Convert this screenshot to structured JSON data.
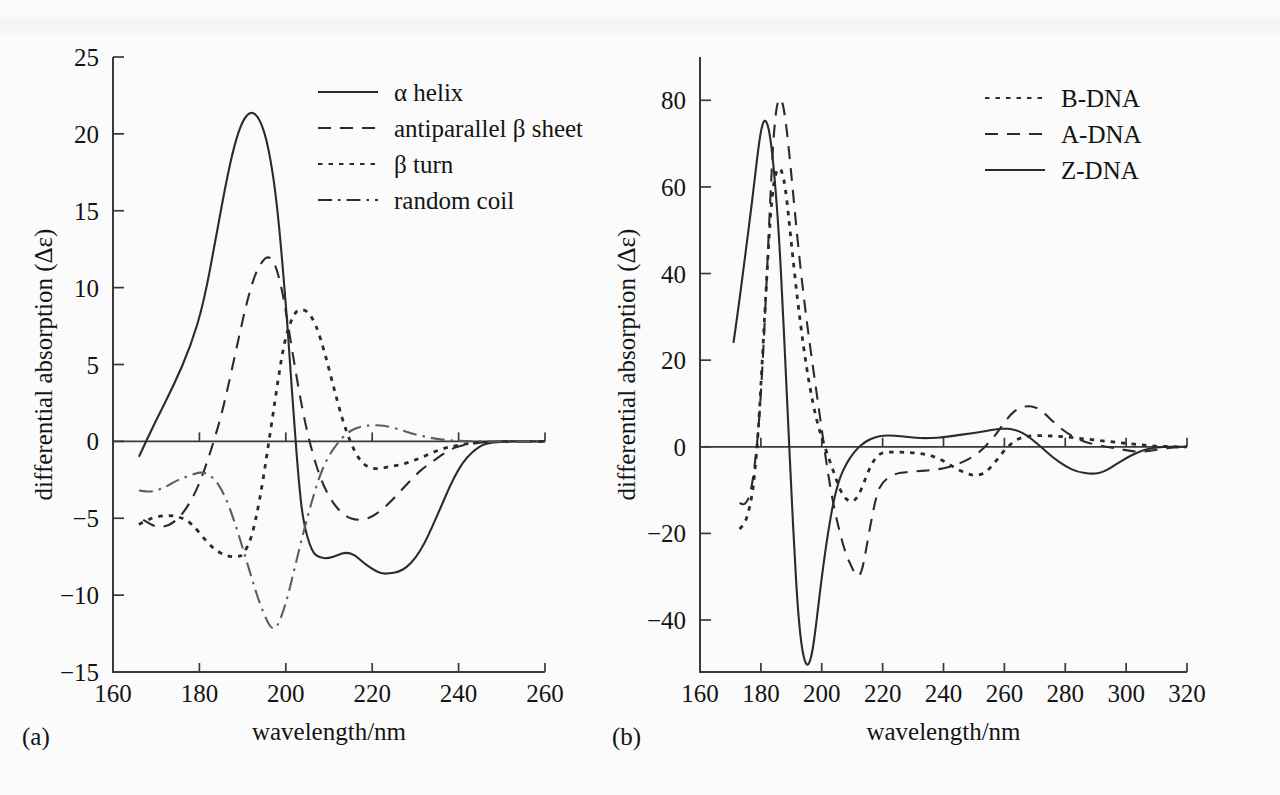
{
  "figure": {
    "background_color": "#fbfbfb",
    "ink_color": "#2b2b2b",
    "grey_color": "#5d5d5d"
  },
  "panels": [
    {
      "tag": "(a)",
      "xlabel": "wavelength/nm",
      "ylabel": "differential absorption (Δε)",
      "xticks": [
        160,
        180,
        200,
        220,
        240,
        260
      ],
      "yticks": [
        25,
        20,
        15,
        10,
        5,
        0,
        -5,
        -10,
        -15
      ],
      "xtick_labels": [
        "160",
        "180",
        "200",
        "220",
        "240",
        "260"
      ],
      "ytick_labels": [
        "25",
        "20",
        "15",
        "10",
        "5",
        "0",
        "−5",
        "−10",
        "−15"
      ],
      "legend": [
        {
          "label": "α helix",
          "style": "solid"
        },
        {
          "label": "antiparallel β sheet",
          "style": "dashed"
        },
        {
          "label": "β turn",
          "style": "dotted"
        },
        {
          "label": "random coil",
          "style": "dashdot"
        }
      ]
    },
    {
      "tag": "(b)",
      "xlabel": "wavelength/nm",
      "ylabel": "differential absorption (Δε)",
      "xticks": [
        160,
        180,
        200,
        220,
        240,
        260,
        280,
        300,
        320
      ],
      "yticks": [
        80,
        60,
        40,
        20,
        0,
        -20,
        -40
      ],
      "xtick_labels": [
        "160",
        "180",
        "200",
        "220",
        "240",
        "260",
        "280",
        "300",
        "320"
      ],
      "ytick_labels": [
        "80",
        "60",
        "40",
        "20",
        "0",
        "−20",
        "−40"
      ],
      "legend": [
        {
          "label": "B-DNA",
          "style": "dotted"
        },
        {
          "label": "A-DNA",
          "style": "dashed"
        },
        {
          "label": "Z-DNA",
          "style": "solid"
        }
      ]
    }
  ],
  "chart_data": [
    {
      "type": "line",
      "title": "",
      "panel": "(a)",
      "xlabel": "wavelength/nm",
      "ylabel": "differential absorption (Δε)",
      "xlim": [
        160,
        260
      ],
      "ylim": [
        -15,
        25
      ],
      "grid": false,
      "legend_position": "top-right",
      "series": [
        {
          "name": "α helix",
          "style": "solid",
          "x": [
            166,
            170,
            174,
            178,
            181,
            184,
            186,
            188,
            190,
            192,
            194,
            196,
            198,
            200,
            201,
            202,
            203,
            204,
            206,
            208,
            210,
            212,
            214,
            216,
            218,
            220,
            222,
            224,
            226,
            228,
            230,
            232,
            234,
            236,
            238,
            240,
            242,
            244,
            246,
            250,
            256,
            260
          ],
          "y": [
            -1.0,
            1.4,
            3.6,
            6.2,
            9.0,
            13.5,
            16.6,
            19.2,
            20.9,
            21.5,
            21.0,
            19.2,
            15.5,
            9.0,
            5.0,
            1.0,
            -2.6,
            -5.2,
            -7.2,
            -7.6,
            -7.6,
            -7.4,
            -7.2,
            -7.4,
            -7.9,
            -8.3,
            -8.6,
            -8.6,
            -8.5,
            -8.2,
            -7.6,
            -6.7,
            -5.5,
            -4.2,
            -2.9,
            -1.8,
            -1.0,
            -0.5,
            -0.15,
            0.0,
            0.0,
            0.0
          ]
        },
        {
          "name": "antiparallel β sheet",
          "style": "dashed",
          "x": [
            167,
            170,
            173,
            176,
            179,
            181,
            183,
            185,
            187,
            189,
            191,
            193,
            195,
            196,
            197,
            198,
            199,
            200,
            202,
            204,
            206,
            208,
            210,
            212,
            214,
            216,
            218,
            220,
            222,
            224,
            226,
            228,
            230,
            232,
            234,
            236,
            238,
            240,
            244,
            250,
            256,
            260
          ],
          "y": [
            -5.1,
            -5.6,
            -5.5,
            -4.8,
            -3.4,
            -2.0,
            -0.3,
            1.6,
            4.0,
            6.6,
            9.1,
            11.0,
            11.9,
            12.0,
            11.8,
            11.1,
            10.0,
            8.5,
            5.0,
            1.8,
            -0.6,
            -2.4,
            -3.6,
            -4.4,
            -4.9,
            -5.1,
            -5.1,
            -4.9,
            -4.5,
            -4.0,
            -3.4,
            -2.8,
            -2.2,
            -1.7,
            -1.3,
            -0.9,
            -0.55,
            -0.3,
            -0.08,
            0.0,
            0.0,
            0.0
          ]
        },
        {
          "name": "β turn",
          "style": "dotted",
          "x": [
            166,
            168,
            170,
            173,
            175,
            177,
            179,
            181,
            183,
            185,
            187,
            189,
            190,
            192,
            194,
            196,
            198,
            199,
            200,
            201,
            202,
            203,
            205,
            207,
            209,
            211,
            213,
            215,
            217,
            219,
            221,
            223,
            225,
            227,
            229,
            231,
            233,
            235,
            237,
            239,
            242,
            246,
            252,
            258,
            260
          ],
          "y": [
            -5.4,
            -5.1,
            -4.9,
            -4.8,
            -4.9,
            -5.1,
            -5.6,
            -6.3,
            -6.9,
            -7.3,
            -7.5,
            -7.5,
            -7.4,
            -6.4,
            -3.8,
            -0.2,
            3.6,
            5.4,
            6.8,
            7.7,
            8.3,
            8.6,
            8.5,
            7.6,
            5.8,
            3.6,
            1.5,
            -0.1,
            -1.2,
            -1.7,
            -1.8,
            -1.7,
            -1.6,
            -1.5,
            -1.3,
            -1.1,
            -0.85,
            -0.6,
            -0.42,
            -0.3,
            -0.15,
            -0.05,
            0.0,
            0.0,
            0.0
          ]
        },
        {
          "name": "random coil",
          "style": "dashdot",
          "x": [
            166,
            169,
            172,
            175,
            178,
            180,
            182,
            184,
            186,
            188,
            190,
            192,
            194,
            196,
            197,
            198,
            200,
            202,
            204,
            206,
            208,
            210,
            212,
            214,
            216,
            218,
            220,
            222,
            224,
            226,
            228,
            230,
            232,
            234,
            236,
            238,
            241,
            245,
            250,
            256,
            260
          ],
          "y": [
            -3.2,
            -3.3,
            -3.0,
            -2.5,
            -2.2,
            -2.0,
            -2.1,
            -2.6,
            -3.6,
            -5.1,
            -6.9,
            -8.8,
            -10.6,
            -11.9,
            -12.2,
            -12.1,
            -10.6,
            -8.3,
            -6.0,
            -3.9,
            -2.1,
            -0.9,
            -0.1,
            0.5,
            0.85,
            1.0,
            1.05,
            1.05,
            0.95,
            0.8,
            0.62,
            0.45,
            0.32,
            0.2,
            0.12,
            0.06,
            0.02,
            0.0,
            0.0,
            0.0,
            0.0
          ]
        }
      ]
    },
    {
      "type": "line",
      "title": "",
      "panel": "(b)",
      "xlabel": "wavelength/nm",
      "ylabel": "differential absorption (Δε)",
      "xlim": [
        160,
        320
      ],
      "ylim": [
        -52,
        90
      ],
      "grid": false,
      "legend_position": "top-right",
      "series": [
        {
          "name": "B-DNA",
          "style": "dotted",
          "x": [
            173,
            175,
            177,
            178,
            179,
            180,
            181,
            182,
            183,
            184,
            185,
            186,
            187,
            188,
            189,
            190,
            192,
            194,
            196,
            198,
            200,
            202,
            204,
            206,
            208,
            210,
            212,
            214,
            216,
            218,
            220,
            224,
            228,
            232,
            236,
            240,
            244,
            248,
            250,
            252,
            254,
            256,
            258,
            260,
            262,
            264,
            266,
            268,
            272,
            276,
            280,
            284,
            288,
            292,
            296,
            300,
            304,
            308,
            312,
            316,
            320
          ],
          "y": [
            -19.0,
            -17.5,
            -12.0,
            -6.0,
            2.0,
            14.0,
            27.0,
            40.0,
            52.0,
            60.0,
            63.5,
            64.5,
            63.5,
            60.0,
            54.0,
            47.0,
            34.0,
            23.0,
            14.0,
            7.0,
            2.0,
            -2.0,
            -6.0,
            -10.0,
            -12.2,
            -12.8,
            -11.5,
            -8.0,
            -4.5,
            -2.2,
            -1.3,
            -1.2,
            -1.3,
            -1.5,
            -2.0,
            -3.2,
            -5.0,
            -6.3,
            -6.6,
            -6.5,
            -5.8,
            -4.4,
            -2.6,
            -0.8,
            0.6,
            1.6,
            2.2,
            2.5,
            2.6,
            2.5,
            2.3,
            2.0,
            1.7,
            1.4,
            1.1,
            0.8,
            0.5,
            0.25,
            0.1,
            0.0,
            0.0
          ]
        },
        {
          "name": "A-DNA",
          "style": "dashed",
          "x": [
            173,
            175,
            177,
            179,
            180,
            181,
            182,
            183,
            184,
            185,
            186,
            187,
            188,
            189,
            190,
            192,
            194,
            196,
            198,
            200,
            202,
            204,
            206,
            208,
            210,
            211,
            212,
            213,
            214,
            216,
            218,
            220,
            224,
            228,
            232,
            236,
            240,
            244,
            248,
            252,
            256,
            258,
            260,
            262,
            264,
            266,
            268,
            270,
            272,
            274,
            276,
            280,
            284,
            288,
            292,
            296,
            300,
            304,
            308,
            312,
            316,
            320
          ],
          "y": [
            -13.0,
            -13.5,
            -10.0,
            2.0,
            12.0,
            25.0,
            40.0,
            56.0,
            70.0,
            78.0,
            80.5,
            80.0,
            76.0,
            70.0,
            63.0,
            48.0,
            35.0,
            24.0,
            14.0,
            4.0,
            -6.0,
            -14.0,
            -20.0,
            -25.0,
            -28.0,
            -29.5,
            -30.0,
            -29.0,
            -26.0,
            -18.0,
            -11.0,
            -8.0,
            -6.2,
            -5.8,
            -5.6,
            -5.4,
            -5.0,
            -4.2,
            -3.0,
            -1.2,
            1.8,
            3.6,
            5.6,
            7.4,
            8.6,
            9.2,
            9.4,
            9.2,
            8.4,
            7.2,
            5.8,
            3.4,
            1.8,
            0.8,
            0.2,
            -0.3,
            -0.8,
            -1.2,
            -1.0,
            -0.4,
            -0.1,
            0.0
          ]
        },
        {
          "name": "Z-DNA",
          "style": "solid",
          "x": [
            171,
            173,
            175,
            177,
            179,
            180,
            181,
            182,
            183,
            184,
            185,
            186,
            187,
            188,
            189,
            190,
            191,
            192,
            193,
            194,
            195,
            196,
            197,
            198,
            200,
            202,
            204,
            206,
            208,
            210,
            212,
            214,
            216,
            218,
            220,
            224,
            228,
            232,
            236,
            240,
            244,
            248,
            252,
            256,
            258,
            260,
            262,
            264,
            266,
            268,
            270,
            272,
            276,
            280,
            284,
            288,
            290,
            292,
            294,
            296,
            300,
            304,
            308,
            312,
            316,
            320
          ],
          "y": [
            24.0,
            34.0,
            45.0,
            56.0,
            68.0,
            73.0,
            75.5,
            75.0,
            72.0,
            66.0,
            58.0,
            48.0,
            35.0,
            20.0,
            5.0,
            -10.0,
            -24.0,
            -36.0,
            -44.0,
            -48.5,
            -50.5,
            -50.0,
            -47.0,
            -42.0,
            -30.0,
            -20.0,
            -12.0,
            -7.0,
            -4.0,
            -1.8,
            -0.2,
            1.0,
            1.8,
            2.3,
            2.6,
            2.6,
            2.3,
            2.0,
            2.0,
            2.2,
            2.6,
            3.0,
            3.4,
            3.9,
            4.1,
            4.2,
            4.1,
            3.8,
            3.2,
            2.3,
            1.2,
            0.0,
            -2.5,
            -4.5,
            -5.8,
            -6.2,
            -6.2,
            -5.9,
            -5.2,
            -4.4,
            -2.6,
            -1.2,
            -0.3,
            0.0,
            0.0,
            0.0
          ]
        }
      ]
    }
  ]
}
